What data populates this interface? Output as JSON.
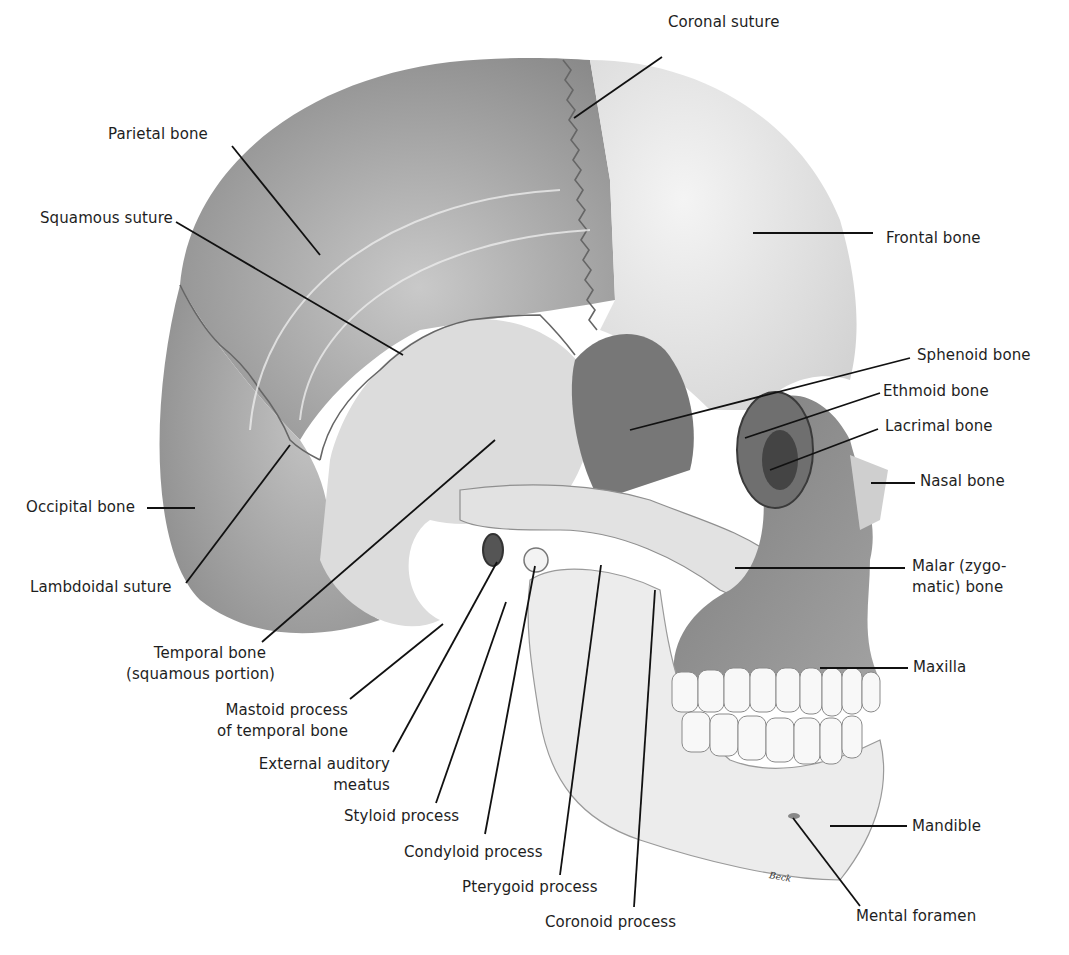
{
  "figure": {
    "signature": "Beck",
    "colors": {
      "background": "#ffffff",
      "leader_line": "#111111",
      "parietal": "#9a9a9a",
      "frontal": "#e6e6e6",
      "occipital": "#b0b0b0",
      "temporal": "#dadada",
      "sphenoid": "#7a7a7a",
      "face": "#8c8c8c",
      "mandible": "#ececec",
      "teeth": "#f7f7f7"
    }
  },
  "labels": [
    {
      "id": "coronal-suture",
      "text": "Coronal suture"
    },
    {
      "id": "parietal-bone",
      "text": "Parietal bone"
    },
    {
      "id": "squamous-suture",
      "text": "Squamous suture"
    },
    {
      "id": "frontal-bone",
      "text": "Frontal bone"
    },
    {
      "id": "sphenoid-bone",
      "text": "Sphenoid bone"
    },
    {
      "id": "ethmoid-bone",
      "text": "Ethmoid bone"
    },
    {
      "id": "lacrimal-bone",
      "text": "Lacrimal bone"
    },
    {
      "id": "nasal-bone",
      "text": "Nasal bone"
    },
    {
      "id": "occipital-bone",
      "text": "Occipital bone"
    },
    {
      "id": "malar-bone",
      "text": "Malar (zygo-",
      "text2": "matic) bone"
    },
    {
      "id": "lambdoidal-suture",
      "text": "Lambdoidal suture"
    },
    {
      "id": "maxilla",
      "text": "Maxilla"
    },
    {
      "id": "temporal-bone",
      "text": "Temporal bone",
      "text2": "(squamous portion)"
    },
    {
      "id": "mastoid-process",
      "text": "Mastoid process",
      "text2": "of temporal bone"
    },
    {
      "id": "external-auditory-meatus",
      "text": "External auditory",
      "text2": "meatus"
    },
    {
      "id": "styloid-process",
      "text": "Styloid process"
    },
    {
      "id": "condyloid-process",
      "text": "Condyloid process"
    },
    {
      "id": "mandible",
      "text": "Mandible"
    },
    {
      "id": "pterygoid-process",
      "text": "Pterygoid process"
    },
    {
      "id": "coronoid-process",
      "text": "Coronoid process"
    },
    {
      "id": "mental-foramen",
      "text": "Mental foramen"
    }
  ]
}
